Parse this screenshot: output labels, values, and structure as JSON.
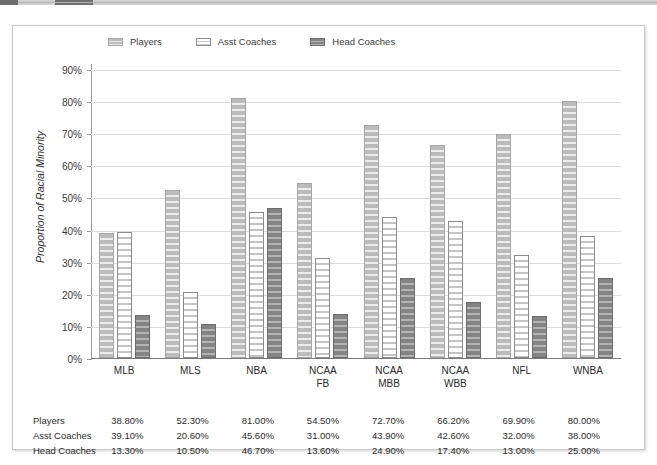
{
  "top_strip": {
    "segment_a": "",
    "segment_b": ""
  },
  "legend": {
    "items": [
      {
        "label": "Players",
        "style": "players"
      },
      {
        "label": "Asst Coaches",
        "style": "asst"
      },
      {
        "label": "Head Coaches",
        "style": "head"
      }
    ]
  },
  "chart_data": {
    "type": "bar",
    "title": "",
    "xlabel": "",
    "ylabel": "Proportion of Racial Minority",
    "ylim": [
      0,
      90
    ],
    "ytick_labels": [
      "0%",
      "10%",
      "20%",
      "30%",
      "40%",
      "50%",
      "60%",
      "70%",
      "80%",
      "90%"
    ],
    "ytick_values": [
      0,
      10,
      20,
      30,
      40,
      50,
      60,
      70,
      80,
      90
    ],
    "grid": true,
    "legend_position": "top",
    "categories": [
      "MLB",
      "MLS",
      "NBA",
      "NCAA FB",
      "NCAA MBB",
      "NCAA WBB",
      "NFL",
      "WNBA"
    ],
    "category_lines": [
      [
        "MLB"
      ],
      [
        "MLS"
      ],
      [
        "NBA"
      ],
      [
        "NCAA",
        "FB"
      ],
      [
        "NCAA",
        "MBB"
      ],
      [
        "NCAA",
        "WBB"
      ],
      [
        "NFL"
      ],
      [
        "WNBA"
      ]
    ],
    "series": [
      {
        "name": "Players",
        "style": "players",
        "values": [
          38.8,
          52.3,
          81.0,
          54.5,
          72.7,
          66.2,
          69.9,
          80.0
        ],
        "labels": [
          "38.80%",
          "52.30%",
          "81.00%",
          "54.50%",
          "72.70%",
          "66.20%",
          "69.90%",
          "80.00%"
        ]
      },
      {
        "name": "Asst Coaches",
        "style": "asst",
        "values": [
          39.1,
          20.6,
          45.6,
          31.0,
          43.9,
          42.6,
          32.0,
          38.0
        ],
        "labels": [
          "39.10%",
          "20.60%",
          "45.60%",
          "31.00%",
          "43.90%",
          "42.60%",
          "32.00%",
          "38.00%"
        ]
      },
      {
        "name": "Head Coaches",
        "style": "head",
        "values": [
          13.3,
          10.5,
          46.7,
          13.6,
          24.9,
          17.4,
          13.0,
          25.0
        ],
        "labels": [
          "13.30%",
          "10.50%",
          "46.70%",
          "13.60%",
          "24.90%",
          "17.40%",
          "13.00%",
          "25.00%"
        ]
      }
    ]
  },
  "colors": {
    "players_fill": "#bcbcbc",
    "asst_fill": "#ffffff",
    "head_fill": "#848484",
    "gridline": "#dcdcdc",
    "axis": "#7a7a7a",
    "text": "#2b2b2b"
  }
}
